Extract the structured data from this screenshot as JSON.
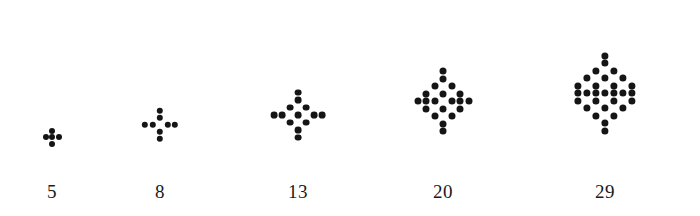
{
  "diagram": {
    "type": "dot-pattern-sequence",
    "title": "",
    "background_color": "#ffffff",
    "dot_color": "#151515",
    "label_color": "#1a1a1a",
    "figure_count": 5,
    "sequence_counts": [
      5,
      8,
      13,
      20,
      29
    ],
    "sequence_differences": [
      3,
      5,
      7,
      9
    ],
    "figures": [
      {
        "name": "figure-1",
        "label": "5",
        "dot_count": 5,
        "dot_radius": 3.0,
        "center_x": 52,
        "center_y": 137,
        "label_x": 52,
        "label_y": 182,
        "step_x": 13,
        "step_y": 13,
        "center_filled": true,
        "rows": [
          {
            "y": -1,
            "cells": [
              0
            ]
          },
          {
            "y": 0,
            "cells": [
              -1,
              0,
              1
            ]
          },
          {
            "y": 1,
            "cells": [
              0
            ]
          }
        ]
      },
      {
        "name": "figure-2",
        "label": "8",
        "dot_count": 8,
        "dot_radius": 3.2,
        "center_x": 160,
        "center_y": 125,
        "label_x": 160,
        "label_y": 182,
        "step_x": 15,
        "step_y": 14,
        "center_filled": false,
        "rows": [
          {
            "y": -2,
            "cells": [
              0
            ]
          },
          {
            "y": -1,
            "cells": [
              0
            ]
          },
          {
            "y": 0,
            "cells": [
              -2,
              -1,
              1,
              2
            ]
          },
          {
            "y": 1,
            "cells": [
              0
            ]
          },
          {
            "y": 2,
            "cells": [
              0
            ]
          }
        ]
      },
      {
        "name": "figure-3",
        "label": "13",
        "dot_count": 13,
        "dot_radius": 3.4,
        "center_x": 298,
        "center_y": 115,
        "label_x": 298,
        "label_y": 182,
        "step_x": 16,
        "step_y": 15,
        "center_filled": true,
        "rows": [
          {
            "y": -3,
            "cells": [
              0
            ]
          },
          {
            "y": -2,
            "cells": [
              0
            ]
          },
          {
            "y": -1,
            "cells": [
              -1,
              1
            ]
          },
          {
            "y": 0,
            "cells": [
              -3,
              -2,
              0,
              2,
              3
            ]
          },
          {
            "y": 1,
            "cells": [
              -1,
              1
            ]
          },
          {
            "y": 2,
            "cells": [
              0
            ]
          },
          {
            "y": 3,
            "cells": [
              0
            ]
          }
        ]
      },
      {
        "name": "figure-4",
        "label": "20",
        "dot_count": 20,
        "dot_radius": 3.5,
        "center_x": 443,
        "center_y": 101,
        "label_x": 443,
        "label_y": 182,
        "step_x": 17,
        "step_y": 15,
        "center_filled": false,
        "rows": [
          {
            "y": -4,
            "cells": [
              0
            ]
          },
          {
            "y": -3,
            "cells": [
              0
            ]
          },
          {
            "y": -2,
            "cells": [
              -1,
              1
            ]
          },
          {
            "y": -1,
            "cells": [
              -2,
              0,
              2
            ]
          },
          {
            "y": 0,
            "cells": [
              -3,
              -2,
              -1,
              1,
              2,
              3
            ]
          },
          {
            "y": 1,
            "cells": [
              -2,
              0,
              2
            ]
          },
          {
            "y": 2,
            "cells": [
              -1,
              1
            ]
          },
          {
            "y": 3,
            "cells": [
              0
            ]
          },
          {
            "y": 4,
            "cells": [
              0
            ]
          }
        ]
      },
      {
        "name": "figure-5",
        "label": "29",
        "dot_count": 29,
        "dot_radius": 3.6,
        "center_x": 605,
        "center_y": 93,
        "label_x": 605,
        "label_y": 182,
        "step_x": 18,
        "step_y": 15,
        "center_filled": true,
        "rows": [
          {
            "y": -5,
            "cells": [
              0
            ]
          },
          {
            "y": -4,
            "cells": [
              0
            ]
          },
          {
            "y": -3,
            "cells": [
              -1,
              1
            ]
          },
          {
            "y": -2,
            "cells": [
              -2,
              0,
              2
            ]
          },
          {
            "y": -1,
            "cells": [
              -3,
              -1,
              1,
              3
            ]
          },
          {
            "y": 0,
            "cells": [
              -3,
              -2,
              -1,
              0,
              1,
              2,
              3
            ]
          },
          {
            "y": 1,
            "cells": [
              -3,
              -1,
              1,
              3
            ]
          },
          {
            "y": 2,
            "cells": [
              -2,
              0,
              2
            ]
          },
          {
            "y": 3,
            "cells": [
              -1,
              1
            ]
          },
          {
            "y": 4,
            "cells": [
              0
            ]
          },
          {
            "y": 5,
            "cells": [
              0
            ]
          }
        ]
      }
    ]
  }
}
